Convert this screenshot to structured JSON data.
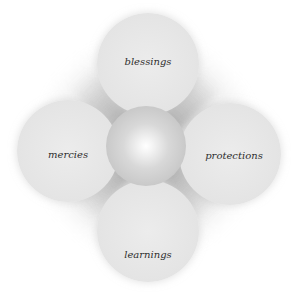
{
  "diagram": {
    "type": "four-petal radial diagram",
    "center": {
      "label": ""
    },
    "petals": [
      {
        "position": "top",
        "label": "blessings"
      },
      {
        "position": "left",
        "label": "mercies"
      },
      {
        "position": "right",
        "label": "protections"
      },
      {
        "position": "bottom",
        "label": "learnings"
      }
    ],
    "colors": {
      "background": "#ffffff",
      "petal": "#e6e6e6",
      "core": "#c8c8c8",
      "glow": "#ffffff",
      "text": "#2e2e2e"
    }
  }
}
